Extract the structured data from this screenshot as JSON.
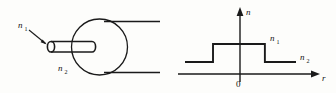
{
  "figure": {
    "background_color": "#fdfdfb",
    "ink_color": "#1a1a1a"
  },
  "fiber_diagram": {
    "name": "fiber-cross-section",
    "core_label": "n",
    "core_label_sub": "1",
    "cladding_label": "n",
    "cladding_label_sub": "2",
    "description": "Cylindrical core rod entering a circular cladding disc with two horizontal cladding boundary lines"
  },
  "index_profile": {
    "name": "refractive-index-profile",
    "vertical_axis_label": "n",
    "horizontal_axis_label": "r",
    "origin_label": "0",
    "high_level_label": "n",
    "high_level_label_sub": "1",
    "low_level_label": "n",
    "low_level_label_sub": "2"
  },
  "chart_data": {
    "type": "line",
    "title": "",
    "xlabel": "r",
    "ylabel": "n",
    "grid": false,
    "legend": null,
    "xlim": [
      -3.2,
      3.2
    ],
    "ylim": [
      0,
      2.2
    ],
    "annotations": [
      {
        "text": "n1",
        "x": 2.1,
        "y": 1.62
      },
      {
        "text": "n2",
        "x": 2.75,
        "y": 0.82
      },
      {
        "text": "0",
        "x": 0.0,
        "y": -0.28
      }
    ],
    "series": [
      {
        "name": "refractive index n(r)",
        "x": [
          -2.6,
          -1.25,
          -1.25,
          1.25,
          1.25,
          2.75
        ],
        "y": [
          0.62,
          0.62,
          1.52,
          1.52,
          0.62,
          0.62
        ]
      }
    ],
    "levels": {
      "core_index_n1": 1.52,
      "cladding_index_n2": 0.62,
      "core_radius": 1.25
    }
  }
}
